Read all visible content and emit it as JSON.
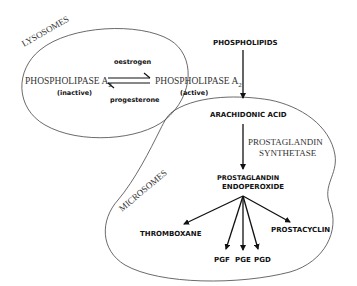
{
  "compartments": {
    "lysosomes": "LYSOSOMES",
    "microsomes": "MICROSOMES"
  },
  "nodes": {
    "pla2_inactive": {
      "name": "PHOSPHOLIPASE A",
      "sub": "2",
      "state": "(inactive)"
    },
    "pla2_active": {
      "name": "PHOSPHOLIPASE A",
      "sub": "2",
      "state": "(active)"
    },
    "phospholipids": "PHOSPHOLIPIDS",
    "arachidonic_acid": "ARACHIDONIC ACID",
    "endoperoxide_line1": "PROSTAGLANDIN",
    "endoperoxide_line2": "ENDOPEROXIDE",
    "thromboxane": "THROMBOXANE",
    "prostacyclin": "PROSTACYCLIN",
    "pgf": "PGF",
    "pge": "PGE",
    "pgd": "PGD"
  },
  "edges": {
    "activation": "oestrogen",
    "inactivation": "progesterone",
    "enzyme_line1": "PROSTAGLANDIN",
    "enzyme_line2": "SYNTHETASE"
  }
}
